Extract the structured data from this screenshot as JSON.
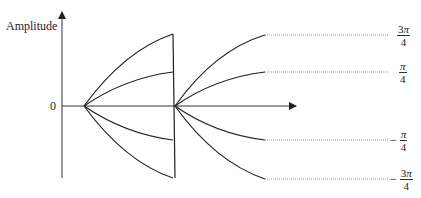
{
  "diagram": {
    "y_axis_label": "Amplitude",
    "origin_label": "0",
    "colors": {
      "stroke": "#222222",
      "dotted": "#9a9a9a",
      "background": "#ffffff"
    },
    "phase_labels": [
      {
        "sign": "",
        "numerator": "3",
        "symbol": "π",
        "denominator": "4",
        "level": "top"
      },
      {
        "sign": "",
        "numerator": "",
        "symbol": "π",
        "denominator": "4",
        "level": "upper"
      },
      {
        "sign": "−",
        "numerator": "",
        "symbol": "π",
        "denominator": "4",
        "level": "lower"
      },
      {
        "sign": "−",
        "numerator": "3",
        "symbol": "π",
        "denominator": "4",
        "level": "bottom"
      }
    ]
  }
}
